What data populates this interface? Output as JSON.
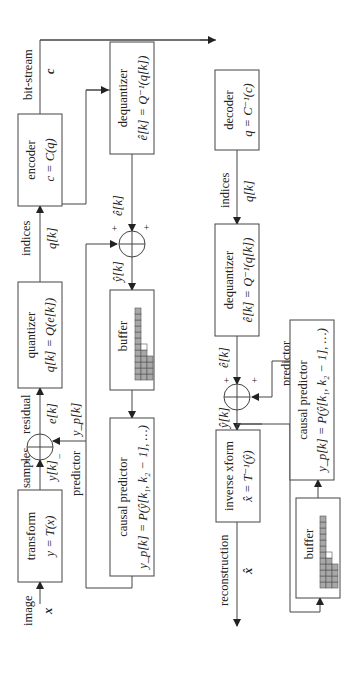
{
  "diagram": {
    "orientation": "rotated-90-ccw",
    "encoder_path": {
      "input_label": "image",
      "input_symbol": "x",
      "transform": {
        "title": "transform",
        "equation": "y = T(x)"
      },
      "samples_label": "samples",
      "samples_symbol": "y[k]",
      "sum_plus": "+",
      "sum_minus": "−",
      "residual_label": "residual",
      "residual_symbol": "e[k]",
      "predictor_label": "predictor",
      "predictor_symbol": "y_p[k]",
      "quantizer": {
        "title": "quantizer",
        "equation": "q[k] = Q(e[k])"
      },
      "indices_label": "indices",
      "indices_symbol": "q[k]",
      "encoder": {
        "title": "encoder",
        "equation": "c = C(q)"
      },
      "bitstream_label": "bit-stream",
      "bitstream_symbol": "c",
      "dequantizer": {
        "title": "dequantizer",
        "equation": "ê[k] = Q⁻¹(q[k])"
      },
      "dequant_out_symbol": "ê[k]",
      "recon_sum_plus_1": "+",
      "recon_sum_plus_2": "+",
      "recon_symbol": "ŷ[k]",
      "buffer": {
        "title": "buffer"
      },
      "causal_predictor": {
        "title": "causal predictor",
        "equation": "y_p[k] = P(ŷ[k₁, k₂ − 1], …)"
      }
    },
    "decoder_path": {
      "decoder": {
        "title": "decoder",
        "equation": "q = C⁻¹(c)"
      },
      "indices_label": "indices",
      "indices_symbol": "q[k]",
      "dequantizer": {
        "title": "dequantizer",
        "equation": "ê[k] = Q⁻¹(q[k])"
      },
      "dequant_out_symbol": "ê[k]",
      "sum_plus_1": "+",
      "sum_plus_2": "+",
      "predictor_label": "predictor",
      "predictor_symbol": "y_p[k]",
      "recon_symbol": "ŷ[k]",
      "inverse": {
        "title": "inverse xform",
        "equation": "x̂ = T⁻¹(ŷ)"
      },
      "reconstruction_label": "reconstruction",
      "reconstruction_symbol": "x̂",
      "buffer": {
        "title": "buffer"
      },
      "causal_predictor": {
        "title": "causal predictor",
        "equation": "y_p[k] = P(ŷ[k₁, k₂ − 1], …)"
      }
    }
  }
}
